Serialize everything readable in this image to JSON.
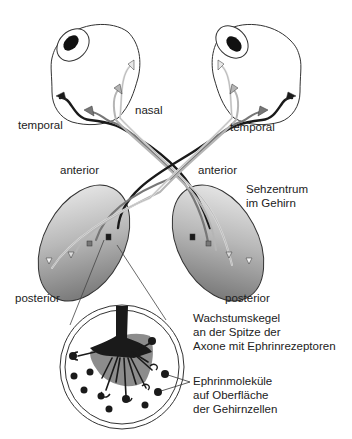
{
  "diagram": {
    "type": "retinotopic-projection",
    "labels": {
      "temporal_left": "temporal",
      "nasal": "nasal",
      "temporal_right": "temporal",
      "anterior_left": "anterior",
      "anterior_right": "anterior",
      "visual_center_line1": "Sehzentrum",
      "visual_center_line2": "im Gehirn",
      "posterior_left": "posterior",
      "posterior_right": "posterior",
      "growth_cone_line1": "Wachstumskegel",
      "growth_cone_line2": "an der Spitze der",
      "growth_cone_line3": "Axone mit Ephrinrezeptoren",
      "ephrin_line1": "Ephrinmoleküle",
      "ephrin_line2": "auf Oberfläche",
      "ephrin_line3": "der Gehirnzellen"
    },
    "colors": {
      "outline": "#333333",
      "axon_dark": "#1a1a1a",
      "axon_mid": "#777777",
      "axon_light": "#b5b5b5",
      "axon_white": "#e8e8e8",
      "brain_gradient_light": "#f2f2f2",
      "brain_gradient_dark": "#8a8a8a",
      "growth_cone_shadow": "#8c8c8c",
      "ephrin_dot": "#1a1a1a"
    }
  }
}
